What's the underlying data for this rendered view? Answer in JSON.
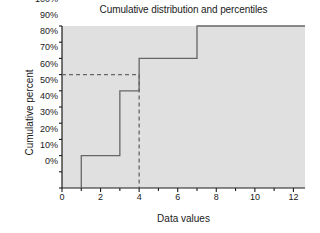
{
  "chart_data": {
    "type": "line",
    "title": "Cumulative distribution and percentiles",
    "xlabel": "Data values",
    "ylabel": "Cumulative percent",
    "xlim": [
      0,
      12.6
    ],
    "ylim": [
      0,
      100
    ],
    "grid": false,
    "legend": null,
    "xticks": [
      0,
      2,
      4,
      6,
      8,
      10,
      12
    ],
    "xtick_labels": [
      "0",
      "2",
      "4",
      "6",
      "8",
      "10",
      "12"
    ],
    "yticks": [
      0,
      10,
      20,
      30,
      40,
      50,
      60,
      70,
      80,
      90,
      100
    ],
    "ytick_labels": [
      "0%",
      "10%",
      "20%",
      "30%",
      "40%",
      "50%",
      "60%",
      "70%",
      "80%",
      "90%",
      "100%"
    ],
    "plot_background": "#e0e0e0",
    "line_color": "#666666",
    "series": [
      {
        "name": "Cumulative distribution (step)",
        "style": "step-post",
        "points": [
          {
            "x": 1,
            "y": 0
          },
          {
            "x": 1,
            "y": 20
          },
          {
            "x": 3,
            "y": 20
          },
          {
            "x": 3,
            "y": 60
          },
          {
            "x": 4,
            "y": 60
          },
          {
            "x": 4,
            "y": 80
          },
          {
            "x": 7,
            "y": 80
          },
          {
            "x": 7,
            "y": 100
          },
          {
            "x": 12.6,
            "y": 100
          }
        ]
      }
    ],
    "annotations": [
      {
        "name": "percentile-guide-horizontal",
        "style": "dashed",
        "color": "#666666",
        "from": {
          "x": 0,
          "y": 70
        },
        "to": {
          "x": 4,
          "y": 70
        },
        "label": "70%"
      },
      {
        "name": "percentile-guide-vertical",
        "style": "dashed",
        "color": "#666666",
        "from": {
          "x": 4,
          "y": 70
        },
        "to": {
          "x": 4,
          "y": 0
        },
        "label": "4"
      }
    ]
  },
  "labels": {
    "title": "Cumulative distribution and percentiles",
    "xlabel": "Data values",
    "ylabel": "Cumulative percent",
    "y0": "0%",
    "y10": "10%",
    "y20": "20%",
    "y30": "30%",
    "y40": "40%",
    "y50": "50%",
    "y60": "60%",
    "y70": "70%",
    "y80": "80%",
    "y90": "90%",
    "y100": "100%",
    "x0": "0",
    "x2": "2",
    "x4": "4",
    "x6": "6",
    "x8": "8",
    "x10": "10",
    "x12": "12"
  }
}
